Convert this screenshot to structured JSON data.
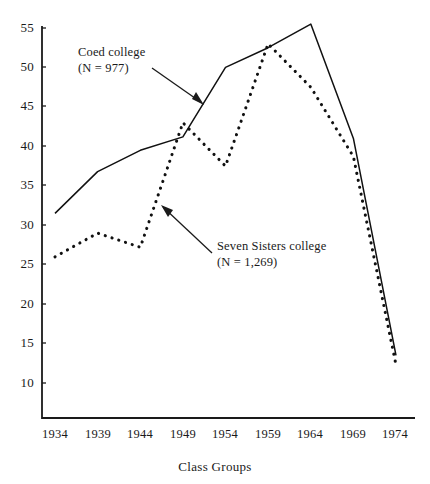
{
  "chart_data": {
    "type": "line",
    "title": "",
    "subtitle": "",
    "xlabel": "Class Groups",
    "ylabel": "",
    "categories": [
      "1934",
      "1939",
      "1944",
      "1949",
      "1954",
      "1959",
      "1964",
      "1969",
      "1974"
    ],
    "xticklabels": [
      "1934",
      "1939",
      "1944",
      "1949",
      "1954",
      "1959",
      "1964",
      "1969",
      "1974"
    ],
    "yticklabels": [
      "10",
      "15",
      "20",
      "25",
      "30",
      "35",
      "40",
      "45",
      "50",
      "55"
    ],
    "yticks": [
      10,
      15,
      20,
      25,
      30,
      35,
      40,
      45,
      50,
      55
    ],
    "ylim": [
      7,
      57
    ],
    "xlim": [
      1932,
      1976
    ],
    "grid": false,
    "legend": "none",
    "series": [
      {
        "name": "Coed college",
        "n_label": "(N = 977)",
        "n": 977,
        "style": "solid",
        "color": "#111111",
        "values": [
          31.5,
          36.8,
          39.5,
          41.2,
          50.0,
          52.5,
          55.5,
          41.0,
          13.5
        ]
      },
      {
        "name": "Seven Sisters college",
        "n_label": "(N = 1,269)",
        "n": 1269,
        "style": "dotted",
        "color": "#111111",
        "values": [
          26.0,
          29.0,
          27.2,
          43.0,
          37.5,
          53.0,
          47.5,
          38.7,
          12.3
        ]
      }
    ],
    "annotations": [
      {
        "id": "coed-annotation",
        "line1": "Coed college",
        "line2": "(N = 977)",
        "target_series": "Coed college",
        "arrow": true
      },
      {
        "id": "seven-sisters-annotation",
        "line1": "Seven Sisters college",
        "line2": "(N = 1,269)",
        "target_series": "Seven Sisters college",
        "arrow": true
      }
    ]
  },
  "axis": {
    "x_title": "Class Groups"
  }
}
